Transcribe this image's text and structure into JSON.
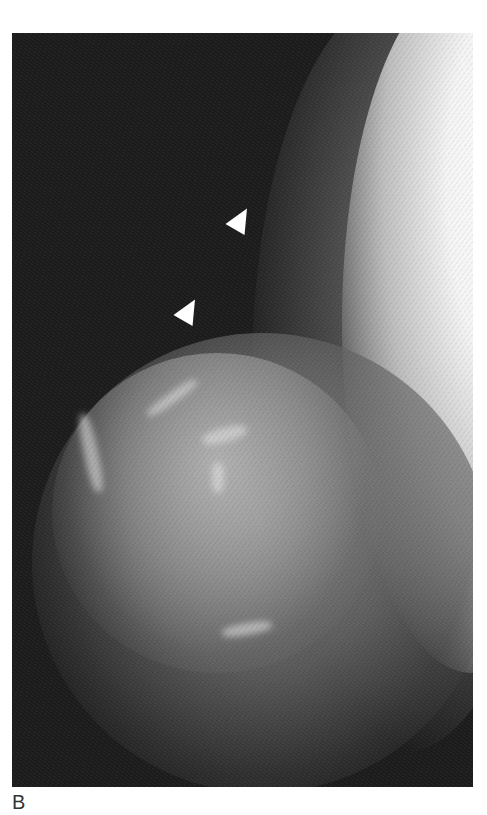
{
  "figure": {
    "panel_label": "B",
    "image_type": "mammogram",
    "annotations": [
      {
        "type": "arrowhead",
        "color": "#ffffff"
      },
      {
        "type": "arrowhead",
        "color": "#ffffff"
      }
    ]
  }
}
